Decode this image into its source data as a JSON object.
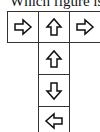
{
  "question": {
    "text": "Which figure is"
  },
  "grid": {
    "cells": [
      {
        "row": 0,
        "col": 0,
        "arrow": "right-arrow-icon"
      },
      {
        "row": 0,
        "col": 1,
        "arrow": "up-arrow-icon"
      },
      {
        "row": 0,
        "col": 2,
        "arrow": "right-arrow-icon"
      },
      {
        "row": 1,
        "col": 1,
        "arrow": "up-arrow-icon"
      },
      {
        "row": 2,
        "col": 1,
        "arrow": "down-arrow-icon"
      },
      {
        "row": 3,
        "col": 1,
        "arrow": "left-arrow-icon"
      }
    ]
  }
}
